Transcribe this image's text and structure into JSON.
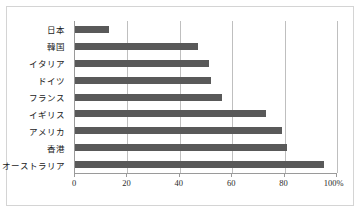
{
  "chart_data": {
    "type": "bar",
    "orientation": "horizontal",
    "title": "",
    "subtitle": "",
    "xlabel": "",
    "ylabel": "",
    "categories": [
      "日本",
      "韓国",
      "イタリア",
      "ドイツ",
      "フランス",
      "イギリス",
      "アメリカ",
      "香港",
      "オーストラリア"
    ],
    "values": [
      13,
      47,
      51,
      52,
      56,
      73,
      79,
      81,
      95
    ],
    "series": [
      {
        "name": "",
        "values": [
          13,
          47,
          51,
          52,
          56,
          73,
          79,
          81,
          95
        ],
        "color": "#595959"
      }
    ],
    "xlim": [
      0,
      100
    ],
    "xticks": [
      0,
      20,
      40,
      60,
      80,
      100
    ],
    "xtick_labels": [
      "0",
      "20",
      "40",
      "60",
      "80",
      "100%"
    ],
    "unit": "%",
    "grid": true,
    "grid_axis": "x",
    "legend": false,
    "legend_position": "none",
    "annotations": []
  },
  "style": {
    "bar_color": "#595959",
    "gridline_color": "#bfbfbf",
    "axis_color": "#9a9a9a",
    "frame_border_color": "#d4d4d4",
    "background": "#ffffff",
    "label_color": "#1a1a1a"
  }
}
